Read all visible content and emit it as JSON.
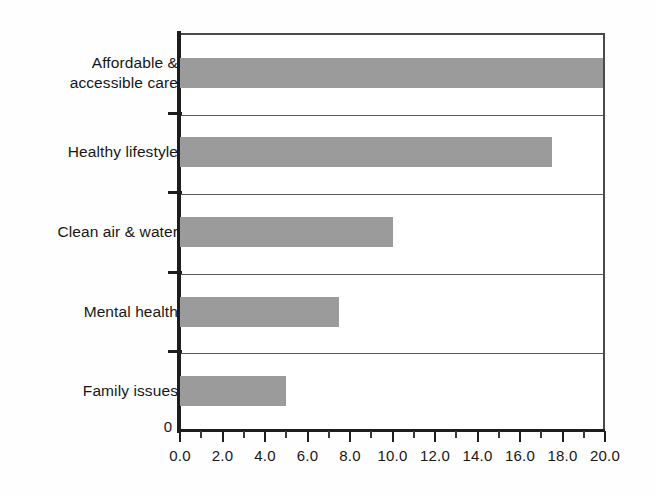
{
  "chart_data": {
    "type": "bar",
    "orientation": "horizontal",
    "title": "",
    "xlabel": "",
    "ylabel": "",
    "categories": [
      "Affordable & accessible care",
      "Healthy lifestyle",
      "Clean air & water",
      "Mental health",
      "Family issues"
    ],
    "category_lines": [
      [
        "Affordable &",
        "accessible care"
      ],
      [
        "Healthy lifestyle"
      ],
      [
        "Clean air & water"
      ],
      [
        "Mental health"
      ],
      [
        "Family issues"
      ]
    ],
    "values": [
      19.9,
      17.5,
      10.0,
      7.5,
      5.0
    ],
    "xlim": [
      0.0,
      20.0
    ],
    "xtick_labels": [
      "0.0",
      "2.0",
      "4.0",
      "6.0",
      "8.0",
      "10.0",
      "12.0",
      "14.0",
      "16.0",
      "18.0",
      "20.0"
    ],
    "xtick_values": [
      0,
      2,
      4,
      6,
      8,
      10,
      12,
      14,
      16,
      18,
      20
    ],
    "xtick_minor_values": [
      1,
      3,
      5,
      7,
      9,
      11,
      13,
      15,
      17,
      19
    ],
    "origin_label": "0",
    "grid": false,
    "legend": false,
    "bar_color": "#9b9b9b",
    "axis_color": "#1d1d1d",
    "separator_color": "#5a5a5a",
    "background_color": "#ffffff"
  }
}
